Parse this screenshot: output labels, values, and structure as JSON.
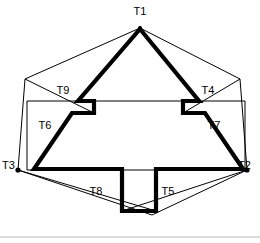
{
  "figure": {
    "background_color": "#ffffff",
    "stroke_color": "#000000",
    "divider_color": "#b9b9b9",
    "width": 260,
    "height": 243,
    "labels": [
      {
        "id": "T1",
        "text": "T1",
        "x": 140,
        "y": 11,
        "anchor": "middle"
      },
      {
        "id": "T2",
        "text": "T2",
        "x": 238,
        "y": 166,
        "anchor": "start"
      },
      {
        "id": "T3",
        "text": "T3",
        "x": 14,
        "y": 166,
        "anchor": "start"
      },
      {
        "id": "T4",
        "text": "T4",
        "x": 205,
        "y": 90,
        "anchor": "middle"
      },
      {
        "id": "T5",
        "text": "T5",
        "x": 168,
        "y": 192,
        "anchor": "middle"
      },
      {
        "id": "T6",
        "text": "T6",
        "x": 45,
        "y": 125,
        "anchor": "middle"
      },
      {
        "id": "T7",
        "text": "T7",
        "x": 212,
        "y": 125,
        "anchor": "middle"
      },
      {
        "id": "T8",
        "text": "T8",
        "x": 96,
        "y": 192,
        "anchor": "middle"
      },
      {
        "id": "T9",
        "text": "T9",
        "x": 63,
        "y": 90,
        "anchor": "middle"
      }
    ],
    "vertex_dots": [
      {
        "id": "dot-T1",
        "x": 140,
        "y": 28,
        "r": 2.1
      },
      {
        "id": "dot-T2",
        "x": 247,
        "y": 170,
        "r": 2.6
      },
      {
        "id": "dot-T3",
        "x": 18,
        "y": 170,
        "r": 2.6
      }
    ],
    "paths": {
      "star_outline": "M 140,29 L 199,101 L 183,101 L 183,113 L 205,113 L 243,169 L 156,169 L 156,211 L 122,211 L 122,169 L 34,169 L 72,113 L 94,113 L 94,101 L 78,101 Z",
      "outer_hexagon": "M 140,28 L 25,79 L 18,170 L 152,215 L 247,170 L 240,79 Z",
      "inner_rectangle": "M 27,101 L 245,101 L 245,170 L 27,170 Z",
      "chord_T9": "M 25,79 L 94,113",
      "chord_T4": "M 240,79 L 183,113",
      "chord_T5": "M 247,170 L 122,211",
      "chord_T8": "M 18,170 L 156,211",
      "divider": "M 0,237 L 260,237"
    }
  }
}
